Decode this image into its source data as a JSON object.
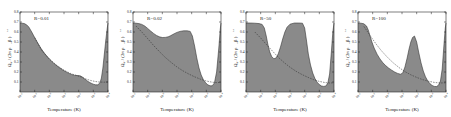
{
  "figure": {
    "type": "multi-panel-plot",
    "panel_count": 4,
    "shared": {
      "xlabel": "Temperature (K)",
      "ylabel_main": "Ω",
      "ylabel_sub": "eff",
      "ylabel_rest": "/ (2π ρ",
      "ylabel_rho_sub": "0",
      "ylabel_tail": " β )",
      "ylabel_exp": "1/2",
      "xticks": [
        "-2",
        "-1",
        "0",
        "1",
        "2",
        "3",
        "4"
      ],
      "xtick_base": "10",
      "yticks": [
        "0.1",
        "0.2",
        "0.3",
        "0.4",
        "0.5",
        "0.6",
        "0.7",
        "0.8"
      ],
      "xlim": [
        -2,
        4
      ],
      "ylim": [
        0,
        0.8
      ],
      "grid": false,
      "legend": "none",
      "shade_color": "#7a7a7a",
      "curve_color": "#2b2b2b",
      "frame_color": "#2b2b2b"
    },
    "panels": [
      {
        "id": "panel-1",
        "label": "R=0.01",
        "chart_data": {
          "type": "area",
          "title": "R=0.01",
          "xlabel": "Temperature (K)",
          "ylabel": "Ωeff/(2πρ0β)^1/2",
          "xlim": [
            -2,
            4
          ],
          "ylim": [
            0,
            0.8
          ],
          "series": [
            {
              "name": "stability-boundary",
              "kind": "filled-area",
              "x": [
                -2.0,
                -1.85,
                -1.7,
                -1.55,
                -1.4,
                -1.2,
                -1.0,
                -0.8,
                -0.55,
                -0.3,
                0.0,
                0.3,
                0.6,
                0.9,
                1.2,
                1.5,
                1.75,
                1.95,
                2.1,
                2.25,
                2.4,
                2.55,
                2.7,
                2.85,
                3.0,
                3.15,
                3.3,
                3.45,
                3.55,
                3.65,
                3.75,
                3.85,
                3.95,
                4.0
              ],
              "y": [
                0.69,
                0.688,
                0.684,
                0.672,
                0.65,
                0.6,
                0.545,
                0.492,
                0.432,
                0.382,
                0.33,
                0.288,
                0.252,
                0.222,
                0.196,
                0.176,
                0.166,
                0.164,
                0.162,
                0.15,
                0.132,
                0.115,
                0.1,
                0.088,
                0.078,
                0.072,
                0.072,
                0.09,
                0.14,
                0.24,
                0.38,
                0.52,
                0.64,
                0.69
              ]
            },
            {
              "name": "asymptotic-curve",
              "kind": "line-dashed",
              "x": [
                -1.0,
                -0.5,
                0.0,
                0.5,
                1.0,
                1.5,
                1.9,
                2.2,
                2.5,
                2.8,
                3.1,
                3.4,
                3.7,
                4.0
              ],
              "y": [
                0.545,
                0.41,
                0.33,
                0.268,
                0.218,
                0.182,
                0.164,
                0.148,
                0.13,
                0.116,
                0.106,
                0.1,
                0.098,
                0.1
              ]
            }
          ]
        }
      },
      {
        "id": "panel-2",
        "label": "R=0.02",
        "chart_data": {
          "type": "area",
          "title": "R=0.02",
          "xlabel": "Temperature (K)",
          "ylabel": "Ωeff/(2πρ0β)^1/2",
          "xlim": [
            -2,
            4
          ],
          "ylim": [
            0,
            0.8
          ],
          "series": [
            {
              "name": "stability-boundary",
              "kind": "filled-area",
              "x": [
                -2.0,
                -1.8,
                -1.6,
                -1.4,
                -1.2,
                -1.0,
                -0.8,
                -0.6,
                -0.4,
                -0.2,
                0.0,
                0.2,
                0.4,
                0.55,
                0.7,
                0.85,
                1.0,
                1.2,
                1.45,
                1.7,
                1.9,
                2.05,
                2.2,
                2.35,
                2.5,
                2.65,
                2.8,
                2.95,
                3.1,
                3.25,
                3.4,
                3.55,
                3.7,
                3.85,
                3.95,
                4.0
              ],
              "y": [
                0.69,
                0.688,
                0.684,
                0.676,
                0.66,
                0.636,
                0.61,
                0.586,
                0.566,
                0.552,
                0.545,
                0.546,
                0.552,
                0.562,
                0.574,
                0.586,
                0.596,
                0.606,
                0.612,
                0.612,
                0.606,
                0.56,
                0.46,
                0.34,
                0.24,
                0.17,
                0.122,
                0.092,
                0.072,
                0.062,
                0.062,
                0.09,
                0.2,
                0.44,
                0.63,
                0.69
              ]
            },
            {
              "name": "asymptotic-curve",
              "kind": "line-dashed",
              "x": [
                -1.8,
                -1.4,
                -1.0,
                -0.6,
                -0.2,
                0.2,
                0.6,
                1.0,
                1.4,
                1.8,
                2.2,
                2.6,
                3.0,
                3.4,
                3.7,
                4.0
              ],
              "y": [
                0.66,
                0.6,
                0.534,
                0.466,
                0.404,
                0.346,
                0.296,
                0.25,
                0.212,
                0.18,
                0.152,
                0.128,
                0.11,
                0.098,
                0.094,
                0.096
              ]
            }
          ]
        }
      },
      {
        "id": "panel-3",
        "label": "R=50",
        "chart_data": {
          "type": "area",
          "title": "R=50",
          "xlabel": "Temperature (K)",
          "ylabel": "Ωeff/(2πρ0β)^1/2",
          "xlim": [
            -2,
            4
          ],
          "ylim": [
            0,
            0.8
          ],
          "series": [
            {
              "name": "stability-boundary",
              "kind": "filled-area",
              "x": [
                -2.0,
                -1.7,
                -1.4,
                -1.1,
                -0.9,
                -0.75,
                -0.62,
                -0.5,
                -0.38,
                -0.25,
                -0.1,
                0.05,
                0.2,
                0.35,
                0.5,
                0.65,
                0.8,
                1.0,
                1.3,
                1.6,
                1.85,
                2.0,
                2.12,
                2.25,
                2.4,
                2.55,
                2.7,
                2.85,
                3.0,
                3.15,
                3.3,
                3.45,
                3.58,
                3.7,
                3.82,
                3.92,
                4.0
              ],
              "y": [
                0.69,
                0.69,
                0.688,
                0.684,
                0.676,
                0.64,
                0.56,
                0.47,
                0.4,
                0.355,
                0.332,
                0.34,
                0.382,
                0.45,
                0.53,
                0.6,
                0.648,
                0.678,
                0.69,
                0.69,
                0.688,
                0.64,
                0.52,
                0.38,
                0.27,
                0.19,
                0.135,
                0.098,
                0.074,
                0.06,
                0.056,
                0.06,
                0.09,
                0.18,
                0.4,
                0.6,
                0.69
              ]
            },
            {
              "name": "asymptotic-curve",
              "kind": "line-dashed",
              "x": [
                -1.4,
                -1.0,
                -0.6,
                -0.2,
                0.2,
                0.6,
                1.0,
                1.4,
                1.8,
                2.2,
                2.6,
                3.0,
                3.4,
                3.7,
                4.0
              ],
              "y": [
                0.6,
                0.54,
                0.474,
                0.41,
                0.348,
                0.294,
                0.248,
                0.208,
                0.176,
                0.148,
                0.124,
                0.106,
                0.094,
                0.09,
                0.092
              ]
            }
          ]
        }
      },
      {
        "id": "panel-4",
        "label": "R=100",
        "chart_data": {
          "type": "area",
          "title": "R=100",
          "xlabel": "Temperature (K)",
          "ylabel": "Ωeff/(2πρ0β)^1/2",
          "xlim": [
            -2,
            4
          ],
          "ylim": [
            0,
            0.8
          ],
          "series": [
            {
              "name": "stability-boundary",
              "kind": "filled-area",
              "x": [
                -2.0,
                -1.8,
                -1.6,
                -1.42,
                -1.3,
                -1.18,
                -1.05,
                -0.9,
                -0.7,
                -0.5,
                -0.3,
                -0.1,
                0.1,
                0.3,
                0.5,
                0.7,
                0.9,
                1.05,
                1.2,
                1.35,
                1.48,
                1.6,
                1.72,
                1.85,
                2.0,
                2.15,
                2.3,
                2.45,
                2.6,
                2.75,
                2.9,
                3.05,
                3.2,
                3.35,
                3.5,
                3.62,
                3.74,
                3.86,
                3.95,
                4.0
              ],
              "y": [
                0.69,
                0.688,
                0.682,
                0.66,
                0.62,
                0.56,
                0.5,
                0.44,
                0.378,
                0.33,
                0.292,
                0.262,
                0.238,
                0.218,
                0.2,
                0.186,
                0.178,
                0.19,
                0.25,
                0.34,
                0.43,
                0.5,
                0.545,
                0.56,
                0.5,
                0.39,
                0.29,
                0.21,
                0.152,
                0.112,
                0.084,
                0.066,
                0.056,
                0.054,
                0.07,
                0.11,
                0.23,
                0.47,
                0.64,
                0.69
              ]
            },
            {
              "name": "asymptotic-curve",
              "kind": "line-dashed",
              "x": [
                -1.6,
                -1.2,
                -0.8,
                -0.4,
                0.0,
                0.4,
                0.8,
                1.2,
                1.6,
                2.0,
                2.4,
                2.8,
                3.2,
                3.6,
                4.0
              ],
              "y": [
                0.656,
                0.57,
                0.486,
                0.412,
                0.348,
                0.292,
                0.244,
                0.204,
                0.172,
                0.146,
                0.124,
                0.108,
                0.096,
                0.09,
                0.092
              ]
            }
          ]
        }
      }
    ]
  }
}
